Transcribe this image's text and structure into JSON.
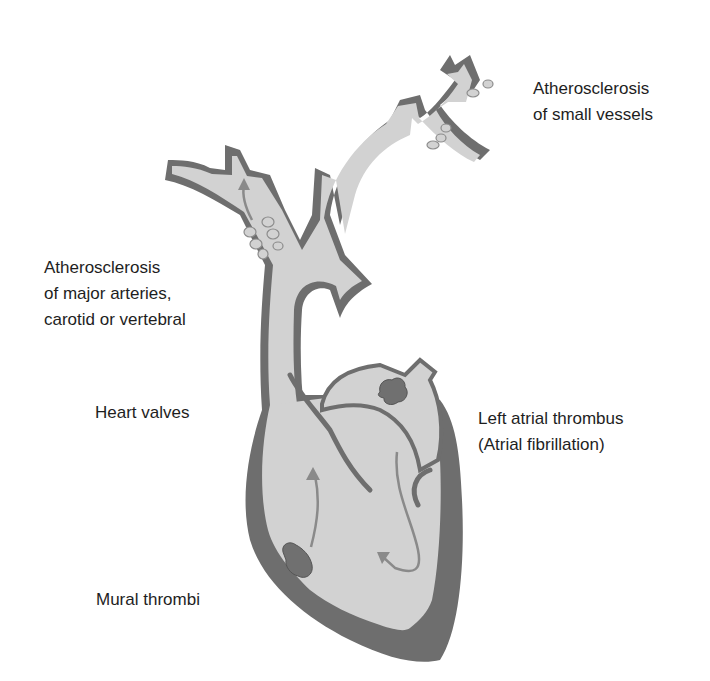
{
  "diagram": {
    "colors": {
      "background": "#ffffff",
      "lumen": "#d2d2d2",
      "wall": "#6e6e6e",
      "thrombus": "#707070",
      "plaque_outline": "#8c8c8c",
      "flow_arrow": "#8a8a8a",
      "text": "#1e1e1e"
    },
    "labels": {
      "small_vessels": {
        "line1": "Atherosclerosis",
        "line2": "of small vessels"
      },
      "major_arteries": {
        "line1": "Atherosclerosis",
        "line2": "of major arteries,",
        "line3": "carotid or vertebral"
      },
      "heart_valves": {
        "line1": "Heart valves"
      },
      "left_atrial": {
        "line1": "Left atrial thrombus",
        "line2": "(Atrial fibrillation)"
      },
      "mural": {
        "line1": "Mural thrombi"
      }
    }
  }
}
